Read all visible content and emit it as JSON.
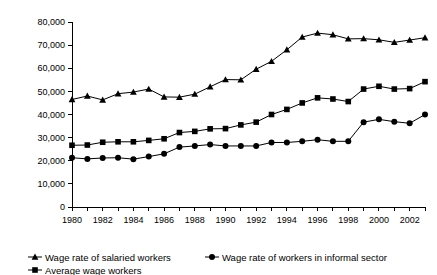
{
  "chart_data": {
    "type": "line",
    "title": "",
    "subtitle": "",
    "xlabel": "",
    "ylabel": "",
    "xlim": [
      1980,
      2003
    ],
    "ylim": [
      0,
      80000
    ],
    "ytick_values": [
      0,
      10000,
      20000,
      30000,
      40000,
      50000,
      60000,
      70000,
      80000
    ],
    "ytick_labels": [
      "0",
      "10,000",
      "20,000",
      "30,000",
      "40,000",
      "50,000",
      "60,000",
      "70,000",
      "80,000"
    ],
    "x": [
      1980,
      1981,
      1982,
      1983,
      1984,
      1985,
      1986,
      1987,
      1988,
      1989,
      1990,
      1991,
      1992,
      1993,
      1994,
      1995,
      1996,
      1997,
      1998,
      1999,
      2000,
      2001,
      2002,
      2003
    ],
    "xtick_values": [
      1980,
      1981,
      1982,
      1983,
      1984,
      1985,
      1986,
      1987,
      1988,
      1989,
      1990,
      1991,
      1992,
      1993,
      1994,
      1995,
      1996,
      1997,
      1998,
      1999,
      2000,
      2001,
      2002,
      2003
    ],
    "xtick_labels_shown": [
      "1980",
      "1982",
      "1984",
      "1986",
      "1988",
      "1990",
      "1992",
      "1994",
      "1996",
      "1998",
      "2000",
      "2002"
    ],
    "xtick_labeled_values": [
      1980,
      1982,
      1984,
      1986,
      1988,
      1990,
      1992,
      1994,
      1996,
      1998,
      2000,
      2002
    ],
    "grid": false,
    "legend_position": "bottom",
    "series": [
      {
        "name": "Wage rate of salaried workers",
        "marker": "triangle",
        "color": "#000000",
        "values": [
          46500,
          48000,
          46300,
          49000,
          49700,
          51000,
          47600,
          47500,
          48800,
          52000,
          55100,
          55000,
          59600,
          63000,
          68000,
          73500,
          75200,
          74500,
          72700,
          72800,
          72300,
          71200,
          72200,
          73200
        ]
      },
      {
        "name": "Average wage workers",
        "marker": "square",
        "color": "#000000",
        "values": [
          26700,
          26800,
          28000,
          28200,
          28200,
          28800,
          29500,
          32200,
          32700,
          33800,
          33900,
          35500,
          36700,
          40000,
          42200,
          45000,
          47200,
          46700,
          45600,
          51000,
          52200,
          51000,
          51200,
          54200
        ]
      },
      {
        "name": "Wage rate of workers in informal sector",
        "marker": "circle",
        "color": "#000000",
        "values": [
          21300,
          20800,
          21200,
          21300,
          20700,
          21800,
          23000,
          25900,
          26400,
          27000,
          26400,
          26400,
          26400,
          27900,
          27900,
          28400,
          29100,
          28400,
          28400,
          36700,
          37900,
          36900,
          36200,
          40000
        ]
      }
    ]
  },
  "legend": {
    "entries": [
      {
        "label": "Wage rate of salaried workers",
        "marker": "triangle"
      },
      {
        "label": "Wage rate of workers in informal sector",
        "marker": "circle"
      },
      {
        "label": "Average wage workers",
        "marker": "square"
      }
    ]
  }
}
